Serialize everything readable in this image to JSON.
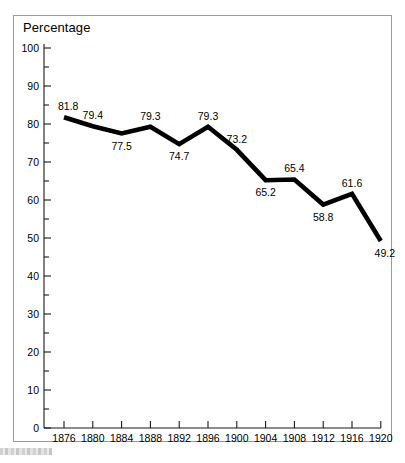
{
  "figure": {
    "axis_title": "Percentage",
    "frame_color": "#9a9a9a",
    "line_color": "#000000",
    "background": "#ffffff"
  },
  "chart_data": {
    "type": "line",
    "title": "",
    "subtitle": "",
    "xlabel": "",
    "ylabel": "Percentage",
    "grid": false,
    "legend": "none",
    "xlim": [
      1874,
      1922
    ],
    "ylim": [
      0,
      100
    ],
    "y_major_step": 10,
    "y_minor_step": 5,
    "categories": [
      "1876",
      "1880",
      "1884",
      "1888",
      "1892",
      "1896",
      "1900",
      "1904",
      "1908",
      "1912",
      "1916",
      "1920"
    ],
    "x": [
      1876,
      1880,
      1884,
      1888,
      1892,
      1896,
      1900,
      1904,
      1908,
      1912,
      1916,
      1920
    ],
    "values": [
      81.8,
      79.4,
      77.5,
      79.3,
      74.7,
      79.3,
      73.2,
      65.2,
      65.4,
      58.8,
      61.6,
      49.2
    ],
    "data_labels": [
      "81.8",
      "79.4",
      "77.5",
      "79.3",
      "74.7",
      "79.3",
      "73.2",
      "65.2",
      "65.4",
      "58.8",
      "61.6",
      "49.2"
    ],
    "data_label_position": [
      "above",
      "above",
      "below",
      "above",
      "below",
      "above",
      "above",
      "below",
      "above",
      "below",
      "above",
      "below"
    ],
    "ytick_labels": [
      "0",
      "10",
      "20",
      "30",
      "40",
      "50",
      "60",
      "70",
      "80",
      "90",
      "100"
    ],
    "ytick_values": [
      0,
      10,
      20,
      30,
      40,
      50,
      60,
      70,
      80,
      90,
      100
    ],
    "yminor_values": [
      5,
      15,
      25,
      35,
      45,
      55,
      65,
      75,
      85,
      95
    ]
  }
}
